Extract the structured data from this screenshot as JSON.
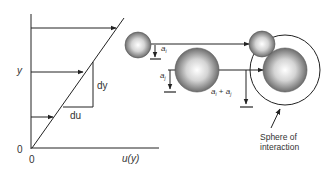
{
  "diagram": {
    "left_panel": {
      "y_axis_label": "y",
      "x_axis_label": "u(y)",
      "origin_y_label": "0",
      "origin_x_label": "0",
      "gradient_vertical_label": "dy",
      "gradient_horizontal_label": "du"
    },
    "right_panel": {
      "particle_i_radius_label": "a",
      "particle_i_subscript": "i",
      "particle_j_radius_label": "a",
      "particle_j_subscript": "j",
      "sum_label_a1": "a",
      "sum_sub_i": "i",
      "sum_plus": " + ",
      "sum_label_a2": "a",
      "sum_sub_j": "j",
      "sphere_label_line1": "Sphere of",
      "sphere_label_line2": "interaction"
    },
    "colors": {
      "line": "#222222",
      "text": "#333333",
      "sphere_light": "#ffffff",
      "sphere_dark": "#555555"
    }
  }
}
